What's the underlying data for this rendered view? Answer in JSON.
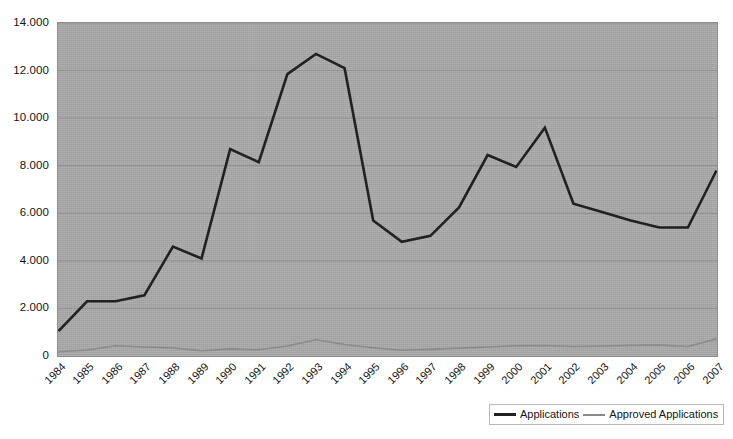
{
  "chart_data": {
    "type": "line",
    "title": "",
    "xlabel": "",
    "ylabel": "",
    "categories": [
      "1984",
      "1985",
      "1986",
      "1987",
      "1988",
      "1989",
      "1990",
      "1991",
      "1992",
      "1993",
      "1994",
      "1995",
      "1996",
      "1997",
      "1998",
      "1999",
      "2000",
      "2001",
      "2002",
      "2003",
      "2004",
      "2005",
      "2006",
      "2007"
    ],
    "ylim": [
      0,
      14000
    ],
    "ytick_labels": [
      "14.000",
      "12.000",
      "10.000",
      "8.000",
      "6.000",
      "4.000",
      "2.000",
      "0"
    ],
    "ytick_values": [
      14000,
      12000,
      10000,
      8000,
      6000,
      4000,
      2000,
      0
    ],
    "grid": true,
    "legend_position": "bottom-right",
    "series": [
      {
        "name": "Applications",
        "color": "#212121",
        "values": [
          1050,
          2300,
          2300,
          2550,
          4600,
          4100,
          8700,
          8150,
          11850,
          12700,
          12100,
          5700,
          4800,
          5050,
          6250,
          8450,
          7950,
          9600,
          6400,
          6050,
          5700,
          5400,
          5400,
          7800
        ]
      },
      {
        "name": "Approved Applications",
        "color": "#8a8a8a",
        "values": [
          180,
          250,
          430,
          380,
          340,
          220,
          300,
          260,
          420,
          680,
          480,
          350,
          240,
          280,
          330,
          380,
          430,
          440,
          400,
          420,
          450,
          460,
          400,
          720
        ]
      }
    ]
  },
  "legend": {
    "entries": [
      {
        "label": "Applications",
        "swatch": "line-swatch-dark"
      },
      {
        "label": "Approved Applications",
        "swatch": "line-swatch-gray"
      }
    ]
  },
  "colors": {
    "plot_background": "#a9a9a9",
    "page_background": "#ffffff",
    "gridline": "#8f8f8f",
    "applications_line": "#212121",
    "approved_line": "#8a8a8a",
    "axis_text": "#141414"
  }
}
